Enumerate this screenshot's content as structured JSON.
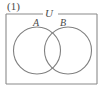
{
  "figure": {
    "number_label": "(1)",
    "type": "venn-diagram"
  },
  "diagram": {
    "universe": {
      "label": "U",
      "shape": "rectangle",
      "label_position": "top-border-center"
    },
    "sets": [
      {
        "id": "set-a",
        "label": "A",
        "shape": "circle",
        "position": "left"
      },
      {
        "id": "set-b",
        "label": "B",
        "shape": "circle",
        "position": "right"
      }
    ],
    "relation": "intersecting",
    "fill": "none"
  },
  "colors": {
    "stroke": "#808080",
    "border": "#8a8a8a",
    "text": "#4a4a4a",
    "background": "#ffffff"
  }
}
